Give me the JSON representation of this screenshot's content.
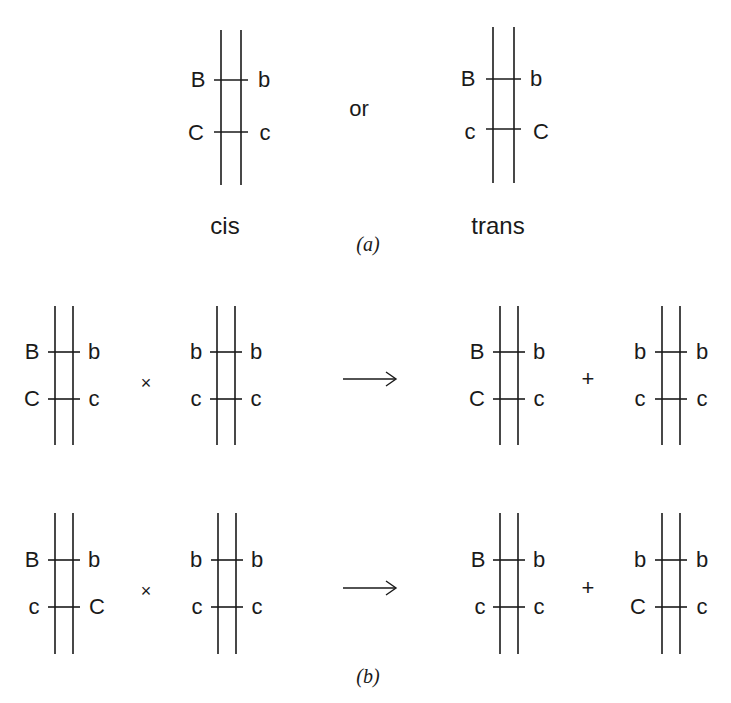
{
  "part_a": {
    "cis": {
      "left_top": "B",
      "right_top": "b",
      "left_bottom": "C",
      "right_bottom": "c",
      "caption": "cis"
    },
    "connector": "or",
    "trans": {
      "left_top": "B",
      "right_top": "b",
      "left_bottom": "c",
      "right_bottom": "C",
      "caption": "trans"
    },
    "label": "(a)"
  },
  "part_b": {
    "row1": {
      "p1": {
        "left_top": "B",
        "right_top": "b",
        "left_bottom": "C",
        "right_bottom": "c"
      },
      "cross": "×",
      "p2": {
        "left_top": "b",
        "right_top": "b",
        "left_bottom": "c",
        "right_bottom": "c"
      },
      "arrow": "⟶",
      "o1": {
        "left_top": "B",
        "right_top": "b",
        "left_bottom": "C",
        "right_bottom": "c"
      },
      "plus": "+",
      "o2": {
        "left_top": "b",
        "right_top": "b",
        "left_bottom": "c",
        "right_bottom": "c"
      }
    },
    "row2": {
      "p1": {
        "left_top": "B",
        "right_top": "b",
        "left_bottom": "c",
        "right_bottom": "C"
      },
      "cross": "×",
      "p2": {
        "left_top": "b",
        "right_top": "b",
        "left_bottom": "c",
        "right_bottom": "c"
      },
      "arrow": "⟶",
      "o1": {
        "left_top": "B",
        "right_top": "b",
        "left_bottom": "c",
        "right_bottom": "c"
      },
      "plus": "+",
      "o2": {
        "left_top": "b",
        "right_top": "b",
        "left_bottom": "C",
        "right_bottom": "c"
      }
    },
    "label": "(b)"
  }
}
